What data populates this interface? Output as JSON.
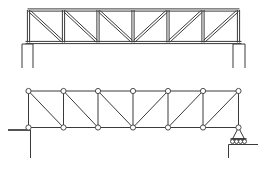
{
  "diagram": {
    "type": "truss-comparison",
    "colors": {
      "line": "#3a3a3a",
      "background": "#ffffff",
      "node_fill": "#ffffff"
    },
    "panel_x": [
      28.5,
      63.5,
      98,
      133,
      168,
      203,
      238.5
    ],
    "structural_truss": {
      "label": "pratt-truss-bridge-drawing",
      "top_y": 10,
      "bottom_y": 42.5,
      "member_gap": 2.2,
      "diagonal_directions": [
        "down-right",
        "down-right",
        "down-right",
        "up-right",
        "up-right",
        "up-right"
      ],
      "supports": [
        {
          "side": "left",
          "posts_x": [
            22,
            33
          ],
          "top_y": 44,
          "bottom_y": 68
        },
        {
          "side": "right",
          "posts_x": [
            233,
            245
          ],
          "top_y": 44,
          "bottom_y": 68
        }
      ]
    },
    "idealized_truss": {
      "label": "pin-jointed-truss-model",
      "top_y": 91,
      "bottom_y": 127.5,
      "node_radius": 2.6,
      "diagonal_directions": [
        "down-right",
        "down-right",
        "down-right",
        "up-right",
        "up-right",
        "up-right"
      ],
      "pin_support": {
        "node_index": 0,
        "ledge_from_x": 8,
        "ledge_y": 130,
        "wall_x": 30.5,
        "wall_bottom_y": 158
      },
      "roller_support": {
        "node_index": 6,
        "triangle_base_y": 139,
        "triangle_half_width": 8,
        "roller_count": 4,
        "roller_radius": 2,
        "roller_y": 141.5,
        "ground_y": 144.5,
        "ground_to_x": 258,
        "wall_x": 228.5,
        "wall_bottom_y": 158
      }
    }
  }
}
